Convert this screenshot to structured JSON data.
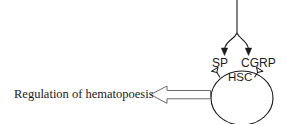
{
  "figure": {
    "background_color": "#ffffff",
    "stroke_color": "#1a1a1a",
    "width": 287,
    "height": 124
  },
  "labels": {
    "regulation": "Regulation of hematopoesis",
    "sp": "SP",
    "cgrp": "CGRP",
    "hsc": "HSC"
  },
  "elements": {
    "nerve_stem": "vertical-nerve-fiber",
    "branch_left": "branch-to-sp",
    "branch_right": "branch-to-cgrp",
    "arrowhead_left": "solid-arrowhead-down",
    "arrowhead_right": "solid-arrowhead-down",
    "receptor_left": "sp-receptor",
    "receptor_right": "cgrp-receptor",
    "cell": "hsc-cell-circle",
    "output_arrow": "hollow-block-arrow-left"
  }
}
